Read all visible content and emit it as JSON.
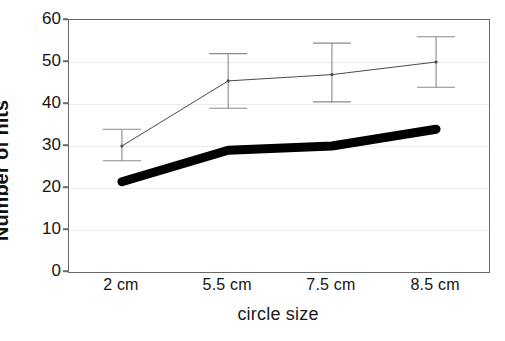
{
  "chart_data": {
    "type": "line",
    "title": "",
    "xlabel": "circle size",
    "ylabel": "Number of hits",
    "categories": [
      "2 cm",
      "5.5 cm",
      "7.5 cm",
      "8.5 cm"
    ],
    "ylim": [
      0,
      60
    ],
    "yticks": [
      0,
      10,
      20,
      30,
      40,
      50,
      60
    ],
    "ytick_labels": [
      "0",
      "10",
      "20",
      "30",
      "40",
      "50",
      "60"
    ],
    "grid": true,
    "grid_axis": "y",
    "legend": "none",
    "series": [
      {
        "name": "thin-line-with-error-bars",
        "style": "thin",
        "color": "#4a4a4a",
        "line_width": 1,
        "values": [
          30,
          45.5,
          47,
          50
        ],
        "error_low": [
          26.5,
          39,
          40.5,
          44
        ],
        "error_high": [
          34,
          52,
          54.5,
          56
        ],
        "has_error_bars": true
      },
      {
        "name": "thick-line",
        "style": "thick",
        "color": "#000000",
        "line_width": 9,
        "values": [
          21.5,
          29,
          30,
          34
        ],
        "has_error_bars": false
      }
    ]
  },
  "axes": {
    "frame_color": "#666a6d",
    "grid_color": "#ebebeb",
    "background": "#ffffff"
  }
}
